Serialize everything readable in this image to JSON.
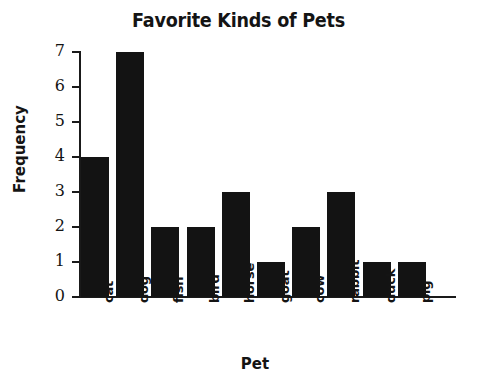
{
  "chart_data": {
    "type": "bar",
    "title": "Favorite Kinds of Pets",
    "xlabel": "Pet",
    "ylabel": "Frequency",
    "categories": [
      "cat",
      "dog",
      "fish",
      "bird",
      "horse",
      "goat",
      "cow",
      "rabbit",
      "duck",
      "pig"
    ],
    "values": [
      4,
      7,
      2,
      2,
      3,
      1,
      2,
      3,
      1,
      1
    ],
    "ylim": [
      0,
      7
    ],
    "yticks": [
      0,
      1,
      2,
      3,
      4,
      5,
      6,
      7
    ],
    "ytick_labels": [
      "0",
      "1",
      "2",
      "3",
      "4",
      "5",
      "6",
      "7"
    ],
    "grid": false,
    "legend": null,
    "bar_color": "#131313",
    "background_color": "#ffffff",
    "axis_color": "#1a1a1a"
  }
}
